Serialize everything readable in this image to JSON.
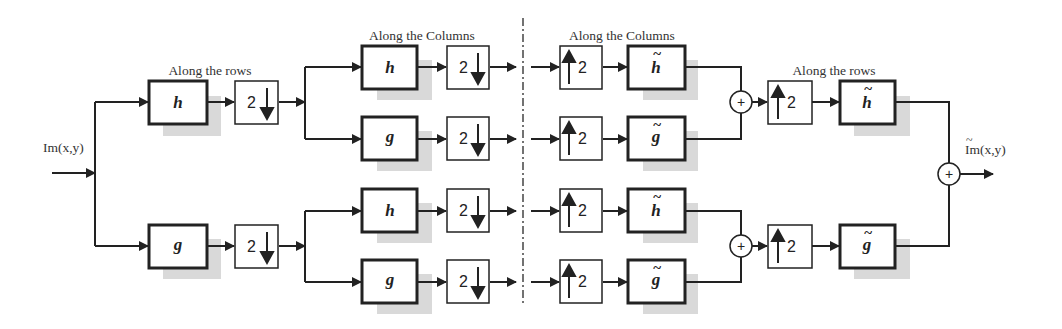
{
  "diagram": {
    "colors": {
      "line": "#222222",
      "shadow": "#d6d6d6",
      "text": "#333333",
      "background": "#ffffff"
    },
    "input_label": "Im(x,y)",
    "output_label": "Im(x,y)",
    "stage_labels": {
      "analysis_rows": "Along the rows",
      "analysis_columns": "Along the Columns",
      "synthesis_columns": "Along the Columns",
      "synthesis_rows": "Along the rows"
    },
    "filters": {
      "h": "h",
      "g": "g",
      "h_tilde": "h",
      "g_tilde": "g",
      "tilde": "~"
    },
    "downsample_label": "2",
    "upsample_label": "2",
    "sum_symbol": "+"
  }
}
